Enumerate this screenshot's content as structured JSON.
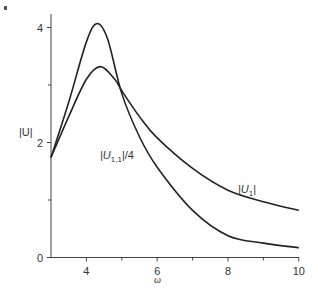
{
  "chart_data": {
    "type": "line",
    "title": "",
    "xlabel": "ω",
    "ylabel": "|U|",
    "xlim": [
      3,
      10
    ],
    "ylim": [
      0,
      4.2
    ],
    "x_ticks": [
      4,
      6,
      8,
      10
    ],
    "x_minor_ticks": [
      5,
      7,
      9
    ],
    "y_ticks": [
      0,
      2,
      4
    ],
    "y_minor_ticks": [
      1,
      3
    ],
    "grid": false,
    "legend": "inline labels",
    "series": [
      {
        "name": "|U_{1,1}|/4",
        "label_main": "|U",
        "label_sub": "1,1",
        "label_tail": "|/4",
        "x": [
          3.0,
          3.5,
          4.0,
          4.3,
          4.6,
          5.0,
          5.5,
          6.0,
          7.0,
          8.0,
          9.0,
          10.0
        ],
        "y": [
          1.74,
          2.7,
          3.75,
          4.07,
          3.8,
          2.85,
          2.1,
          1.57,
          0.82,
          0.38,
          0.25,
          0.17
        ]
      },
      {
        "name": "|U_1|",
        "label_main": "|U",
        "label_sub": "1",
        "label_tail": "|",
        "x": [
          3.0,
          3.5,
          4.0,
          4.4,
          4.8,
          5.0,
          5.5,
          6.0,
          7.0,
          8.0,
          9.0,
          10.0
        ],
        "y": [
          1.74,
          2.45,
          3.1,
          3.32,
          3.1,
          2.9,
          2.45,
          2.08,
          1.55,
          1.17,
          0.97,
          0.82
        ]
      }
    ]
  },
  "plot": {
    "y_tick_labels": [
      "0",
      "2",
      "4"
    ],
    "x_tick_labels": [
      "4",
      "6",
      "8",
      "10"
    ],
    "xlabel": "ω",
    "ylabel": "|U|"
  }
}
